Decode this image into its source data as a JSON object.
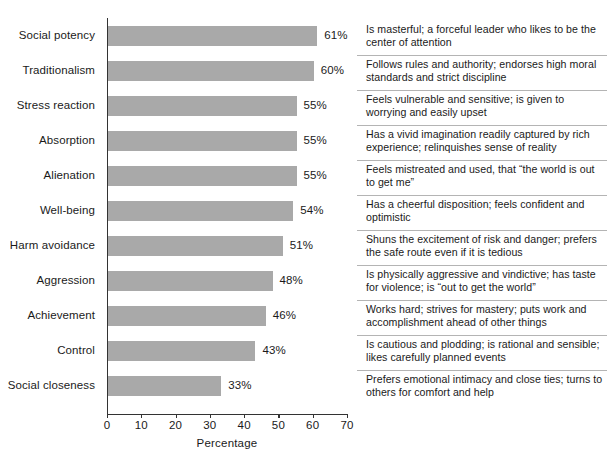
{
  "chart_data": {
    "type": "bar",
    "orientation": "horizontal",
    "title": "",
    "xlabel": "Percentage",
    "ylabel": "",
    "xlim": [
      0,
      70
    ],
    "xticks": [
      0,
      10,
      20,
      30,
      40,
      50,
      60,
      70
    ],
    "grid": false,
    "legend": null,
    "bar_color": "#a9a9a9",
    "value_suffix": "%",
    "categories": [
      "Social potency",
      "Traditionalism",
      "Stress reaction",
      "Absorption",
      "Alienation",
      "Well-being",
      "Harm avoidance",
      "Aggression",
      "Achievement",
      "Control",
      "Social closeness"
    ],
    "values": [
      61,
      60,
      55,
      55,
      55,
      54,
      51,
      48,
      46,
      43,
      33
    ],
    "value_labels": [
      "61%",
      "60%",
      "55%",
      "55%",
      "55%",
      "54%",
      "51%",
      "48%",
      "46%",
      "43%",
      "33%"
    ],
    "annotations": [
      "Is masterful; a forceful leader who likes to be the center of attention",
      "Follows rules and authority; endorses high moral standards and strict discipline",
      "Feels vulnerable and sensitive; is given to worrying and easily upset",
      "Has a vivid imagination readily captured by rich experience; relinquishes sense of reality",
      "Feels mistreated and used, that “the world is out to get me”",
      "Has a cheerful disposition; feels confident and optimistic",
      "Shuns the excitement of risk and danger; prefers the safe route even if it is tedious",
      "Is physically aggressive and vindictive; has taste for violence; is “out to get the world”",
      "Works hard; strives for mastery; puts work and accomplishment ahead of other things",
      "Is cautious and plodding; is rational and sensible; likes carefully planned events",
      "Prefers emotional intimacy and close ties; turns to others for comfort and help"
    ]
  }
}
